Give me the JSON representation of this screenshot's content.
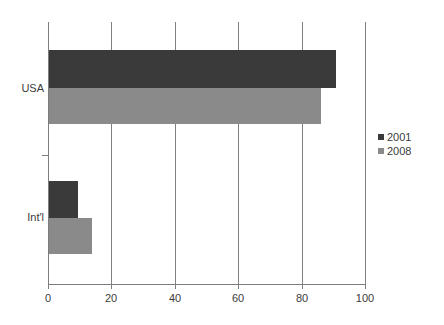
{
  "chart_data": {
    "type": "bar",
    "orientation": "horizontal",
    "title": "",
    "subtitle": "",
    "xlabel": "",
    "ylabel": "",
    "categories": [
      "USA",
      "Int'l"
    ],
    "series": [
      {
        "name": "2001",
        "color": "#3a3a3a",
        "values": [
          91,
          9.5
        ]
      },
      {
        "name": "2008",
        "color": "#8a8a8a",
        "values": [
          86,
          14
        ]
      }
    ],
    "xlim": [
      0,
      100
    ],
    "xticks": [
      0,
      20,
      40,
      60,
      80,
      100
    ],
    "xtick_labels": [
      "0",
      "20",
      "40",
      "60",
      "80",
      "100"
    ],
    "grid": {
      "vertical": true,
      "horizontal": false
    },
    "legend": {
      "position": "right",
      "entries": [
        "2001",
        "2008"
      ]
    },
    "background": "#ffffff"
  },
  "axis": {
    "tick_labels": [
      "0",
      "20",
      "40",
      "60",
      "80",
      "100"
    ],
    "category_labels": [
      "USA",
      "Int'l"
    ]
  },
  "legend": {
    "entries": [
      {
        "label": "2001"
      },
      {
        "label": "2008"
      }
    ]
  }
}
